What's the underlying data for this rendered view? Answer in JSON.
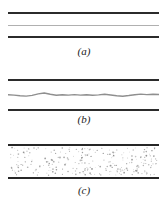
{
  "figure": {
    "background_color": "#ffffff",
    "wall_color": "#2b2b2b",
    "center_line_color": "#b0b0b0",
    "wave_color": "#8f8f8f",
    "speckle_color": "#8a8a8a"
  },
  "panels": [
    {
      "id": "a",
      "caption": "(a)",
      "interior_label": "laminar",
      "wall_top_label": "upper-wall",
      "wall_bottom_label": "lower-wall",
      "center_feature": "straight-thin-line"
    },
    {
      "id": "b",
      "caption": "(b)",
      "interior_label": "wavy",
      "wall_top_label": "upper-wall",
      "wall_bottom_label": "lower-wall",
      "center_feature": "wavy-line"
    },
    {
      "id": "c",
      "caption": "(c)",
      "interior_label": "turbulent",
      "wall_top_label": "upper-wall",
      "wall_bottom_label": "lower-wall",
      "center_feature": "speckle-field"
    }
  ],
  "chart_data": {
    "type": "line",
    "xlabel": "",
    "ylabel": "",
    "xlim": [
      0,
      1
    ],
    "ylim": [
      -1,
      1
    ],
    "grid": false,
    "legend": null,
    "series": [
      {
        "name": "panel-a-center-line",
        "panel": "a",
        "x": [
          0.0,
          0.25,
          0.5,
          0.75,
          1.0
        ],
        "values": [
          0.0,
          0.0,
          0.0,
          0.0,
          0.0
        ]
      },
      {
        "name": "panel-b-wavy-line",
        "panel": "b",
        "x": [
          0.0,
          0.04,
          0.08,
          0.12,
          0.16,
          0.2,
          0.24,
          0.28,
          0.32,
          0.36,
          0.4,
          0.44,
          0.48,
          0.52,
          0.56,
          0.6,
          0.64,
          0.68,
          0.72,
          0.76,
          0.8,
          0.84,
          0.88,
          0.92,
          0.96,
          1.0
        ],
        "values": [
          0.04,
          -0.02,
          -0.1,
          -0.16,
          -0.06,
          0.16,
          0.28,
          0.1,
          -0.04,
          0.04,
          -0.02,
          0.06,
          -0.02,
          0.04,
          -0.04,
          0.02,
          0.1,
          0.0,
          -0.1,
          -0.18,
          -0.08,
          0.04,
          0.12,
          0.06,
          0.1,
          0.08
        ]
      },
      {
        "name": "panel-c-speckles",
        "panel": "c",
        "point_count": 260,
        "distribution": "uniform-random"
      }
    ]
  }
}
